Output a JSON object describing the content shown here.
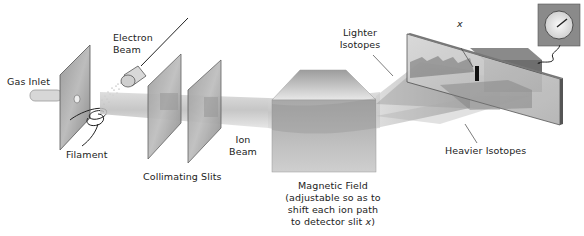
{
  "diagram": {
    "type": "mass-spectrometer-schematic",
    "labels": {
      "gas_inlet": "Gas Inlet",
      "electron_beam_line1": "Electron",
      "electron_beam_line2": "Beam",
      "filament": "Filament",
      "collimating_slits": "Collimating Slits",
      "ion_beam_line1": "Ion",
      "ion_beam_line2": "Beam",
      "magnetic_field_line1": "Magnetic Field",
      "magnetic_field_line2": "(adjustable so as to",
      "magnetic_field_line3": "shift each ion path",
      "magnetic_field_line4_prefix": "to detector slit ",
      "magnetic_field_line4_var": "x",
      "magnetic_field_line4_suffix": ")",
      "lighter_isotopes_line1": "Lighter",
      "lighter_isotopes_line2": "Isotopes",
      "heavier_isotopes": "Heavier Isotopes",
      "detector_slit": "x"
    },
    "components": [
      "gas-inlet-tube",
      "ionization-plate",
      "filament-coil",
      "electron-gun",
      "collimating-slit-1",
      "collimating-slit-2",
      "ion-beam",
      "magnet",
      "isotope-beams",
      "detector-plate",
      "detector-box",
      "meter-gauge"
    ],
    "colors": {
      "plate_dark": "#7a7a7a",
      "plate_light": "#c8c8c8",
      "beam": "#bdbdbd",
      "text": "#222222"
    }
  }
}
